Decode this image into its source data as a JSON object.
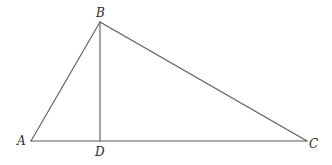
{
  "diagram": {
    "type": "triangle-with-altitude",
    "points": {
      "A": {
        "x": 31,
        "y": 141
      },
      "B": {
        "x": 100,
        "y": 22
      },
      "C": {
        "x": 307,
        "y": 141
      },
      "D": {
        "x": 100,
        "y": 141
      }
    },
    "segments": [
      {
        "id": "AB",
        "from": "A",
        "to": "B"
      },
      {
        "id": "BC",
        "from": "B",
        "to": "C"
      },
      {
        "id": "AC",
        "from": "A",
        "to": "C"
      },
      {
        "id": "BD",
        "from": "B",
        "to": "D"
      }
    ],
    "labels": {
      "A": "A",
      "B": "B",
      "C": "C",
      "D": "D"
    },
    "stroke_color": "#5a5a5a",
    "label_color": "#2a2a2a"
  }
}
